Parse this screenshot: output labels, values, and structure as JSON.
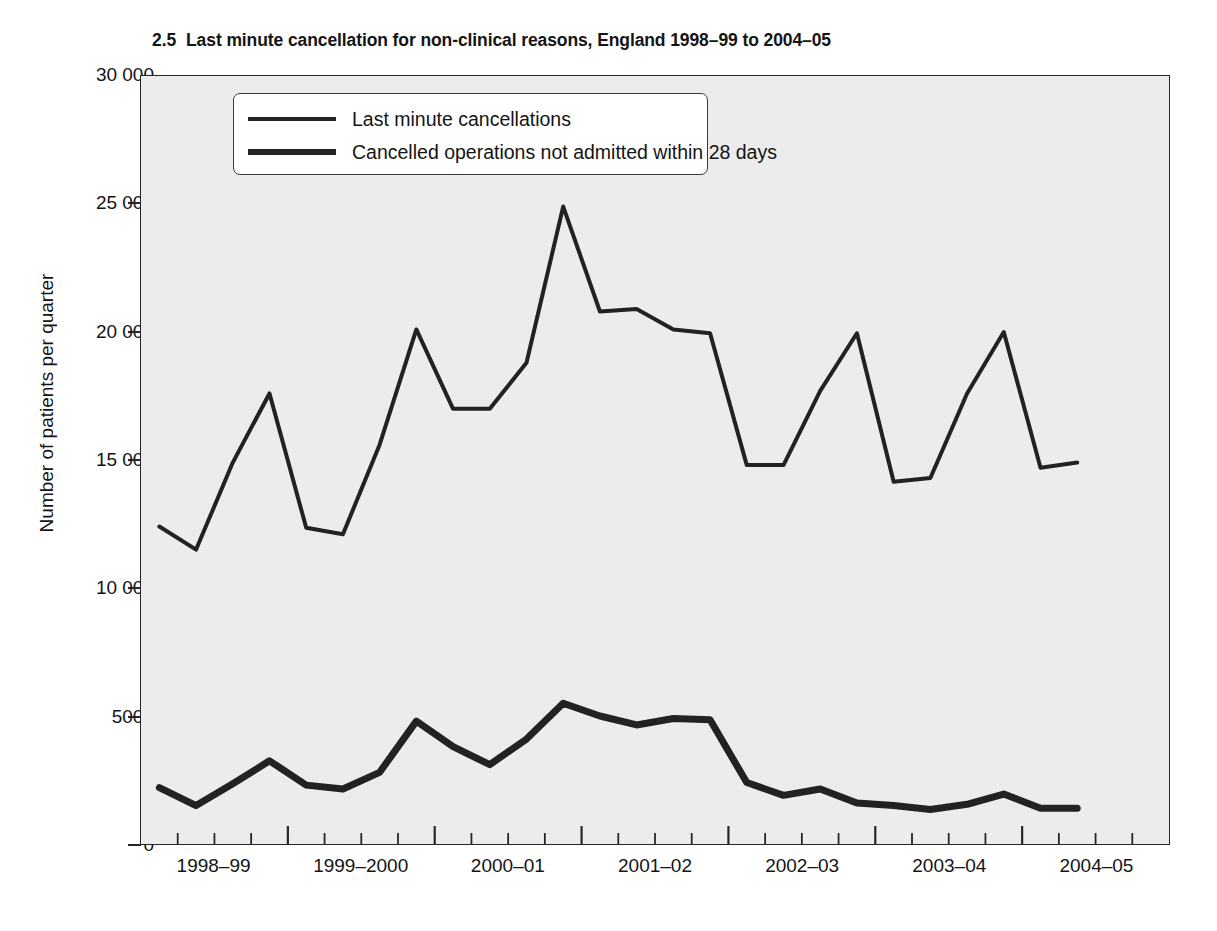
{
  "title": {
    "number": "2.5",
    "text": "Last minute cancellation for non-clinical reasons, England 1998–99 to 2004–05",
    "full": "2.5  Last minute cancellation for non-clinical reasons, England 1998–99 to 2004–05"
  },
  "legend": {
    "position": "top-left-inside",
    "items": [
      {
        "label": "Last minute cancellations",
        "color": "#222222",
        "width": "thin"
      },
      {
        "label": "Cancelled operations not admitted within 28 days",
        "color": "#222222",
        "width": "thick"
      }
    ]
  },
  "chart_data": {
    "type": "line",
    "xlabel": "",
    "ylabel": "Number of patients per quarter",
    "ylim": [
      0,
      30000
    ],
    "ytick_labels": [
      "0",
      "5000",
      "10 000",
      "15 000",
      "20 000",
      "25 000",
      "30 000"
    ],
    "ytick_values": [
      0,
      5000,
      10000,
      15000,
      20000,
      25000,
      30000
    ],
    "xtick_labels": [
      "1998–99",
      "1999–2000",
      "2000–01",
      "2001–02",
      "2002–03",
      "2003–04",
      "2004–05"
    ],
    "x": [
      "1998-99 Q1",
      "1998-99 Q2",
      "1998-99 Q3",
      "1998-99 Q4",
      "1999-2000 Q1",
      "1999-2000 Q2",
      "1999-2000 Q3",
      "1999-2000 Q4",
      "2000-01 Q1",
      "2000-01 Q2",
      "2000-01 Q3",
      "2000-01 Q4",
      "2001-02 Q1",
      "2001-02 Q2",
      "2001-02 Q3",
      "2001-02 Q4",
      "2002-03 Q1",
      "2002-03 Q2",
      "2002-03 Q3",
      "2002-03 Q4",
      "2003-04 Q1",
      "2003-04 Q2",
      "2003-04 Q3",
      "2003-04 Q4",
      "2004-05 Q1",
      "2004-05 Q2"
    ],
    "grid": false,
    "background": "#ececec",
    "series": [
      {
        "name": "Last minute cancellations",
        "color": "#222222",
        "line_width": 4,
        "values": [
          12400,
          11500,
          14900,
          17600,
          12350,
          12100,
          15600,
          20100,
          17000,
          17000,
          18800,
          24900,
          20800,
          20900,
          20100,
          19950,
          14800,
          14800,
          17700,
          19950,
          14150,
          14300,
          17600,
          20000,
          14700,
          14900
        ]
      },
      {
        "name": "Cancelled operations not admitted within 28 days",
        "color": "#222222",
        "line_width": 7,
        "values": [
          2200,
          1500,
          2350,
          3250,
          2300,
          2150,
          2800,
          4800,
          3800,
          3100,
          4100,
          5500,
          5000,
          4650,
          4900,
          4850,
          2400,
          1900,
          2150,
          1600,
          1500,
          1350,
          1550,
          1950,
          1400,
          1400
        ]
      }
    ]
  }
}
